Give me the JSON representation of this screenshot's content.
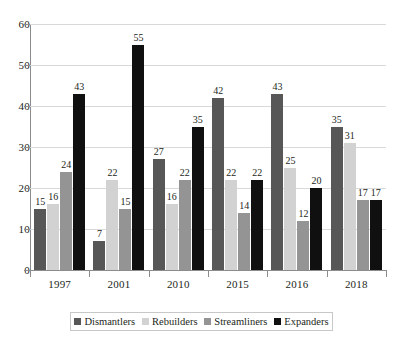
{
  "chart_data": {
    "type": "bar",
    "title": "",
    "subtitle": "",
    "xlabel": "",
    "ylabel": "",
    "categories": [
      "1997",
      "2001",
      "2010",
      "2015",
      "2016",
      "2018"
    ],
    "series": [
      {
        "name": "Dismantlers",
        "color": "#575757",
        "values": [
          15,
          7,
          27,
          42,
          43,
          35
        ]
      },
      {
        "name": "Rebuilders",
        "color": "#d2d2d2",
        "values": [
          16,
          22,
          16,
          22,
          25,
          31
        ]
      },
      {
        "name": "Streamliners",
        "color": "#949494",
        "values": [
          24,
          15,
          22,
          14,
          12,
          17
        ]
      },
      {
        "name": "Expanders",
        "color": "#101010",
        "values": [
          43,
          55,
          35,
          22,
          20,
          17
        ]
      }
    ],
    "ylim": [
      0,
      60
    ],
    "yticks": [
      0,
      10,
      20,
      30,
      40,
      50,
      60
    ],
    "ytick_labels": [
      "0",
      "10",
      "20",
      "30",
      "40",
      "50",
      "60"
    ],
    "grid": true,
    "grid_axis": "y",
    "legend_position": "bottom",
    "data_labels": true
  }
}
